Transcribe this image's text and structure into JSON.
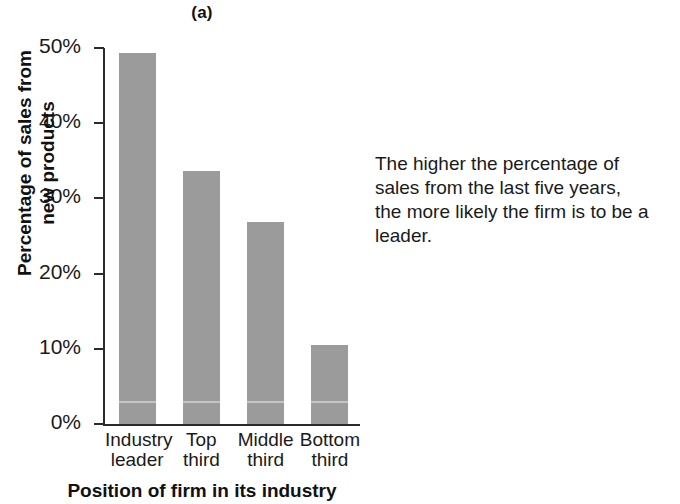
{
  "figure": {
    "panel_label": "(a)",
    "annotation_lines": [
      "The higher the percentage of",
      "sales from the last five years,",
      "the more likely the firm is to be a",
      "leader."
    ]
  },
  "chart_data": {
    "type": "bar",
    "title": "(a)",
    "xlabel": "Position of firm in its industry",
    "ylabel": "Percentage of sales from new products",
    "categories": [
      "Industry leader",
      "Top third",
      "Middle third",
      "Bottom third"
    ],
    "category_lines": [
      [
        "Industry",
        "leader"
      ],
      [
        "Top",
        "third"
      ],
      [
        "Middle",
        "third"
      ],
      [
        "Bottom",
        "third"
      ]
    ],
    "values": [
      49.3,
      33.6,
      26.9,
      10.5
    ],
    "ylim": [
      0,
      50
    ],
    "yticks": [
      0,
      10,
      20,
      30,
      40,
      50
    ],
    "ytick_labels": [
      "0%",
      "10%",
      "20%",
      "30%",
      "40%",
      "50%"
    ],
    "grid": false,
    "legend": null,
    "bar_color": "#9b9b9b",
    "axis_color": "#2b2b2b"
  }
}
